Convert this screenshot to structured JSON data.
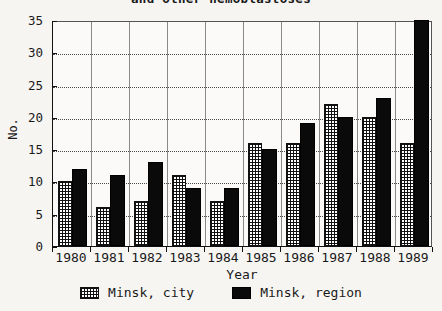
{
  "chart_data": {
    "type": "bar",
    "title": "and other hemoblastoses",
    "xlabel": "Year",
    "ylabel": "No.",
    "categories": [
      "1980",
      "1981",
      "1982",
      "1983",
      "1984",
      "1985",
      "1986",
      "1987",
      "1988",
      "1989"
    ],
    "series": [
      {
        "name": "Minsk, city",
        "values": [
          10,
          6,
          7,
          11,
          7,
          16,
          16,
          22,
          20,
          16
        ]
      },
      {
        "name": "Minsk, region",
        "values": [
          12,
          11,
          13,
          9,
          9,
          15,
          19,
          20,
          23,
          35
        ]
      }
    ],
    "ylim": [
      0,
      35
    ],
    "yticks": [
      0,
      5,
      10,
      15,
      20,
      25,
      30,
      35
    ],
    "grid": "horizontal-dotted-and-vertical-group-separators",
    "legend_position": "bottom-center",
    "colors": {
      "city": "#ffffff",
      "city_hatch": "#111111",
      "region": "#0a0a0a",
      "axis": "#111111",
      "gridline": "#4a4a4a",
      "background": "#f7f5f2"
    }
  }
}
